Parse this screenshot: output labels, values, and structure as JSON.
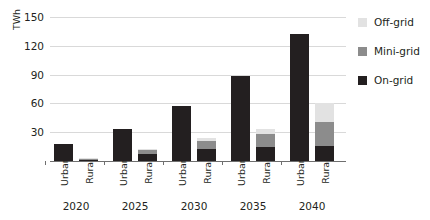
{
  "chart_data": {
    "type": "bar",
    "stacked": true,
    "title": "",
    "xlabel": "",
    "ylabel": "TWh",
    "ylim": [
      0,
      150
    ],
    "yticks": [
      30,
      60,
      90,
      120,
      150
    ],
    "grid": true,
    "legend_position": "right",
    "groups": [
      "2020",
      "2025",
      "2030",
      "2035",
      "2040"
    ],
    "categories": [
      "Urban",
      "Rural"
    ],
    "series": [
      {
        "name": "On-grid",
        "color": "#231f20",
        "values": {
          "2020": {
            "Urban": 18,
            "Rural": 1
          },
          "2025": {
            "Urban": 33,
            "Rural": 7
          },
          "2030": {
            "Urban": 57,
            "Rural": 12
          },
          "2035": {
            "Urban": 89,
            "Rural": 15
          },
          "2040": {
            "Urban": 132,
            "Rural": 16
          }
        }
      },
      {
        "name": "Mini-grid",
        "color": "#8c8c8c",
        "values": {
          "2020": {
            "Urban": 0,
            "Rural": 1
          },
          "2025": {
            "Urban": 0,
            "Rural": 4
          },
          "2030": {
            "Urban": 0,
            "Rural": 9
          },
          "2035": {
            "Urban": 0,
            "Rural": 13
          },
          "2040": {
            "Urban": 0,
            "Rural": 25
          }
        }
      },
      {
        "name": "Off-grid",
        "color": "#e2e2e2",
        "values": {
          "2020": {
            "Urban": 0,
            "Rural": 1
          },
          "2025": {
            "Urban": 0,
            "Rural": 2
          },
          "2030": {
            "Urban": 0,
            "Rural": 3
          },
          "2035": {
            "Urban": 0,
            "Rural": 5
          },
          "2040": {
            "Urban": 0,
            "Rural": 19
          }
        }
      }
    ],
    "totals": {
      "2020": {
        "Urban": 18,
        "Rural": 3
      },
      "2025": {
        "Urban": 33,
        "Rural": 13
      },
      "2030": {
        "Urban": 57,
        "Rural": 24
      },
      "2035": {
        "Urban": 89,
        "Rural": 33
      },
      "2040": {
        "Urban": 132,
        "Rural": 60
      }
    }
  },
  "axis": {
    "y_label": "TWh",
    "y_ticks": [
      "150",
      "120",
      "90",
      "60",
      "30"
    ]
  },
  "legend": {
    "items": [
      {
        "label": "Off-grid",
        "swatch": "off"
      },
      {
        "label": "Mini-grid",
        "swatch": "mini"
      },
      {
        "label": "On-grid",
        "swatch": "on"
      }
    ]
  },
  "x_axis": {
    "groups": [
      {
        "year": "2020",
        "bars": [
          "Urban",
          "Rural"
        ]
      },
      {
        "year": "2025",
        "bars": [
          "Urban",
          "Rural"
        ]
      },
      {
        "year": "2030",
        "bars": [
          "Urban",
          "Rural"
        ]
      },
      {
        "year": "2035",
        "bars": [
          "Urban",
          "Rural"
        ]
      },
      {
        "year": "2040",
        "bars": [
          "Urban",
          "Rural"
        ]
      }
    ]
  }
}
